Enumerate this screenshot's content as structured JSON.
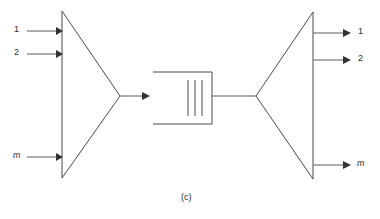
{
  "figure": {
    "caption": "(c)",
    "mux": {
      "name": "multiplexer",
      "inputs": [
        {
          "label": "1"
        },
        {
          "label": "2"
        },
        {
          "label": "m"
        }
      ]
    },
    "link": {
      "name": "transmission-medium",
      "inner_line_count": 3
    },
    "demux": {
      "name": "demultiplexer",
      "outputs": [
        {
          "label": "1"
        },
        {
          "label": "2"
        },
        {
          "label": "m"
        }
      ]
    },
    "colors": {
      "line": "#4a4a4a",
      "arrow": "#333333",
      "text": "#2b2b2b",
      "background": "#ffffff"
    }
  }
}
